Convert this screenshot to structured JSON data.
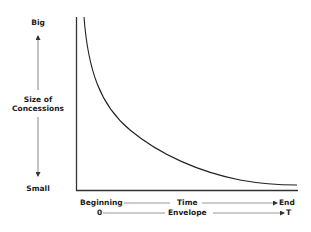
{
  "y_axis": {
    "top_label": "Big",
    "title_line1": "Size of",
    "title_line2": "Concessions",
    "bottom_label": "Small"
  },
  "x_axis": {
    "row1": {
      "start": "Beginning",
      "middle": "Time",
      "end": "End"
    },
    "row2": {
      "start": "0",
      "middle": "Envelope",
      "end": "T"
    }
  },
  "curve": {
    "description": "Concession size decreases over time, steep at beginning, flattening toward end",
    "color": "#222222"
  },
  "colors": {
    "ink": "#222222",
    "background": "#ffffff"
  }
}
